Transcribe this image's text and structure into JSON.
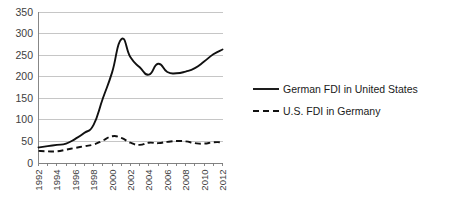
{
  "chart_data": {
    "type": "line",
    "title": "",
    "subtitle": "",
    "xlabel": "",
    "ylabel": "",
    "ylim": [
      0,
      350
    ],
    "ytick_step": 50,
    "yticks": [
      "0",
      "50",
      "100",
      "150",
      "200",
      "250",
      "300",
      "350"
    ],
    "grid": true,
    "grid_axis": "y",
    "legend_position": "right",
    "x": [
      1992,
      1993,
      1994,
      1995,
      1996,
      1997,
      1998,
      1999,
      2000,
      2001,
      2002,
      2003,
      2004,
      2005,
      2006,
      2007,
      2008,
      2009,
      2010,
      2011,
      2012
    ],
    "xticks_shown": [
      "1992",
      "1994",
      "1996",
      "1998",
      "2000",
      "2002",
      "2004",
      "2006",
      "2008",
      "2010",
      "2012"
    ],
    "xlim": [
      1992,
      2012
    ],
    "series": [
      {
        "name": "German FDI in United States",
        "style": "solid",
        "color": "#111111",
        "values": [
          36,
          39,
          42,
          45,
          56,
          70,
          89,
          150,
          210,
          287,
          245,
          222,
          205,
          230,
          211,
          208,
          212,
          220,
          235,
          252,
          263
        ]
      },
      {
        "name": "U.S. FDI in Germany",
        "style": "dashed",
        "color": "#111111",
        "values": [
          28,
          27,
          27,
          31,
          35,
          39,
          43,
          52,
          62,
          58,
          47,
          42,
          47,
          46,
          49,
          51,
          50,
          46,
          45,
          48,
          48
        ]
      }
    ]
  },
  "legend": {
    "items": [
      {
        "label": "German FDI in United States",
        "style": "solid"
      },
      {
        "label": "U.S. FDI in Germany",
        "style": "dashed"
      }
    ]
  }
}
